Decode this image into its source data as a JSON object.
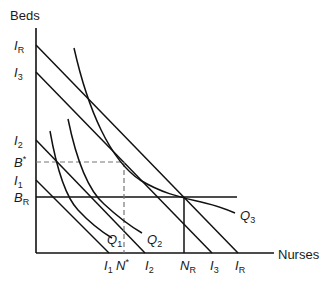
{
  "diagram": {
    "type": "isoquant-isocost",
    "axes": {
      "y_label": "Beds",
      "x_label": "Nurses"
    },
    "y_ticks": [
      {
        "main": "I",
        "sub": "R"
      },
      {
        "main": "I",
        "sub": "3"
      },
      {
        "main": "I",
        "sub": "2"
      },
      {
        "main": "B",
        "sub": "*"
      },
      {
        "main": "I",
        "sub": "1"
      },
      {
        "main": "B",
        "sub": "R"
      }
    ],
    "x_ticks": [
      {
        "main": "I",
        "sub": "1"
      },
      {
        "main": "N",
        "sub": "*"
      },
      {
        "main": "I",
        "sub": "2"
      },
      {
        "main": "N",
        "sub": "R"
      },
      {
        "main": "I",
        "sub": "3"
      },
      {
        "main": "I",
        "sub": "R"
      }
    ],
    "curves": [
      {
        "main": "Q",
        "sub": "1"
      },
      {
        "main": "Q",
        "sub": "2"
      },
      {
        "main": "Q",
        "sub": "3"
      }
    ],
    "colors": {
      "line": "#111111",
      "dashed": "#777777"
    }
  }
}
